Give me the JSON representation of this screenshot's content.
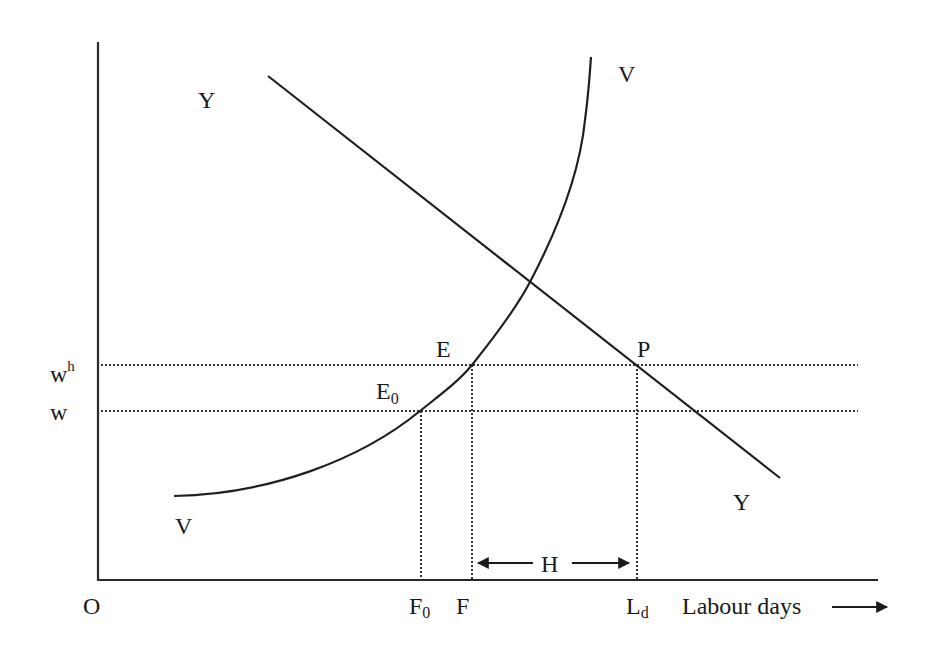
{
  "diagram": {
    "title": "",
    "axes": {
      "origin_label": "O",
      "x_axis_label": "Labour days",
      "y_axis_label": ""
    },
    "y_levels": [
      {
        "label_base": "w",
        "label_sup": "h",
        "name": "wh"
      },
      {
        "label_base": "w",
        "label_sup": "",
        "name": "w"
      }
    ],
    "x_ticks": [
      {
        "label_base": "F",
        "label_sub": "0",
        "name": "F0"
      },
      {
        "label_base": "F",
        "label_sub": "",
        "name": "F"
      },
      {
        "label_base": "L",
        "label_sub": "d",
        "name": "Ld"
      }
    ],
    "curves": [
      {
        "name": "YY",
        "label_start": "Y",
        "label_end": "Y",
        "shape": "downward-sloping straight line"
      },
      {
        "name": "VV",
        "label_start": "V",
        "label_end": "V",
        "shape": "upward-sloping convex curve"
      }
    ],
    "points": [
      {
        "label_base": "E",
        "label_sub": "0",
        "desc": "VV intersects w"
      },
      {
        "label_base": "E",
        "label_sub": "",
        "desc": "VV intersects wh"
      },
      {
        "label_base": "P",
        "label_sub": "",
        "desc": "YY intersects wh"
      }
    ],
    "interval": {
      "label": "H",
      "from": "F",
      "to": "Ld"
    }
  }
}
